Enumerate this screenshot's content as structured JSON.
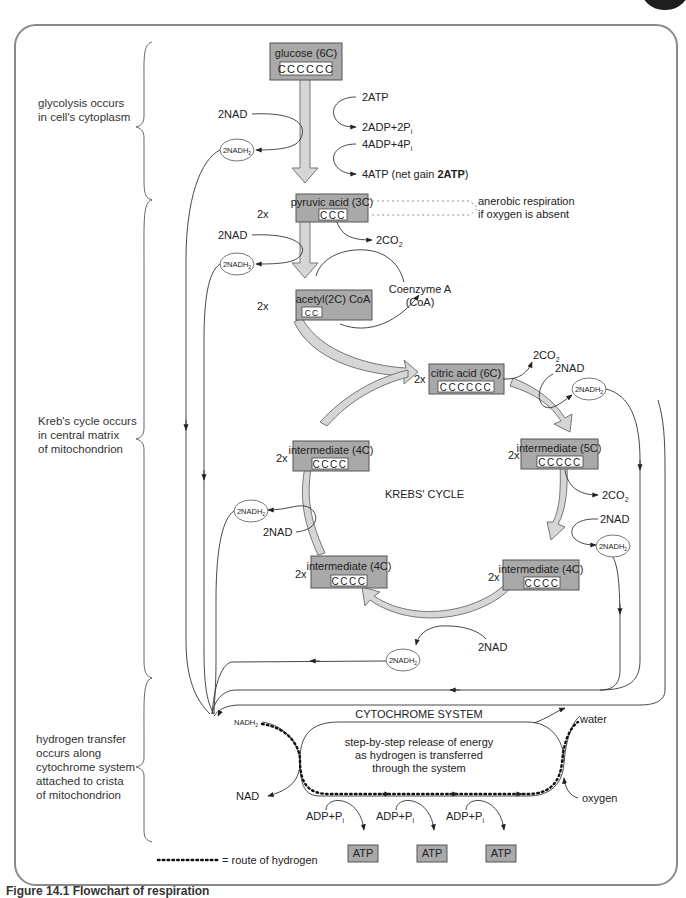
{
  "regions": [
    {
      "label": "glycolysis occurs\nin cell's cytoplasm",
      "lines": [
        "glycolysis occurs",
        "in cell's cytoplasm"
      ]
    },
    {
      "label": "Kreb's cycle occurs in central matrix of mitochondrion",
      "lines": [
        "Kreb's cycle occurs",
        "in central matrix",
        "of mitochondrion"
      ]
    },
    {
      "label": "hydrogen transfer occurs along cytochrome system attached to crista of mitochondrion",
      "lines": [
        "hydrogen transfer",
        "occurs along",
        "cytochrome system",
        "attached to crista",
        "of mitochondrion"
      ]
    }
  ],
  "molecules": {
    "glucose": {
      "name": "glucose (6C)",
      "carbons": "CCCCCC"
    },
    "pyruvic": {
      "name": "pyruvic acid (3C)",
      "carbons": "CCC",
      "mult": "2x"
    },
    "acetyl": {
      "name": "acetyl(2C) CoA",
      "carbons": "CC",
      "mult": "2x"
    },
    "citric": {
      "name": "citric acid (6C)",
      "carbons": "CCCCCC",
      "mult": "2x"
    },
    "int5c": {
      "name": "intermediate (5C)",
      "carbons": "CCCCC",
      "mult": "2x"
    },
    "int4c_right": {
      "name": "intermediate (4C)",
      "carbons": "CCCC",
      "mult": "2x"
    },
    "int4c_bottom": {
      "name": "intermediate (4C)",
      "carbons": "CCCC",
      "mult": "2x"
    },
    "int4c_left": {
      "name": "intermediate (4C)",
      "carbons": "CCCC",
      "mult": "2x"
    }
  },
  "labels": {
    "atp_in": "2ATP",
    "adp_out": "2ADP+2P",
    "adp_in": "4ADP+4P",
    "atp_out_prefix": "4ATP (net gain ",
    "atp_out_bold": "2ATP",
    "atp_out_suffix": ")",
    "sub_i": "i",
    "nad": "2NAD",
    "nadh2": "2NADH",
    "sub_2": "2",
    "co2": "2CO",
    "anaerobic_1": "anerobic respiration",
    "anaerobic_2": "if oxygen is absent",
    "coenzyme_1": "Coenzyme A",
    "coenzyme_2": "(CoA)",
    "krebs": "KREBS' CYCLE",
    "cytochrome": "CYTOCHROME SYSTEM",
    "cyto_desc_1": "step-by-step release of energy",
    "cyto_desc_2": "as hydrogen is transferred",
    "cyto_desc_3": "through the system",
    "nadh2_small": "NADH",
    "nad_out": "NAD",
    "water": "water",
    "oxygen": "oxygen",
    "adp_p": "ADP+P",
    "atp": "ATP"
  },
  "legend": {
    "dots": "···········",
    "text": "= route of hydrogen"
  },
  "caption": "Figure 14.1  Flowchart of respiration"
}
